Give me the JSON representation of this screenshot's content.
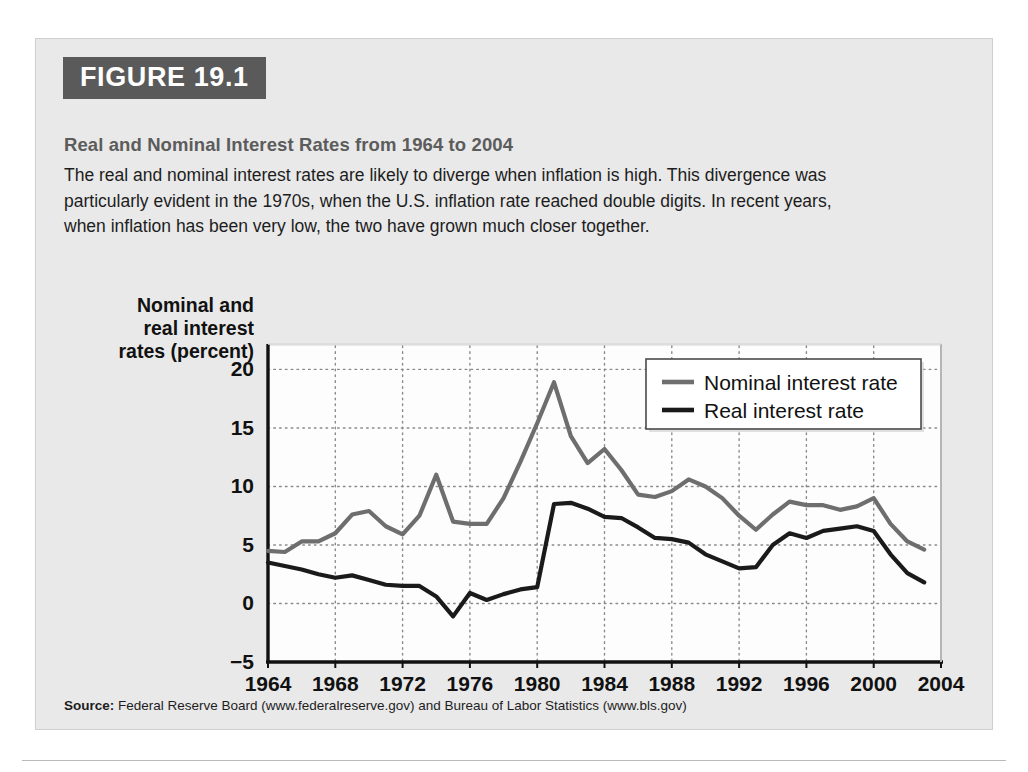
{
  "figure": {
    "tag": "FIGURE 19.1",
    "title": "Real and Nominal Interest Rates from 1964 to 2004",
    "caption": "The real and nominal interest rates are likely to diverge when inflation is high. This divergence was particularly evident in the 1970s, when the U.S. inflation rate reached double digits. In recent years, when inflation has been very low, the two have grown much closer together.",
    "source_label": "Source:",
    "source_text": "Federal Reserve Board (www.federalreserve.gov) and Bureau of Labor Statistics (www.bls.gov)"
  },
  "colors": {
    "panel_bg": "#e9e9e9",
    "tag_bg": "#5a5a5a",
    "title_text": "#5c5c5c",
    "nominal_line": "#6e6e6e",
    "real_line": "#1a1a1a",
    "grid": "#8a8a8a",
    "plot_bg": "#fdfdfd"
  },
  "chart_data": {
    "type": "line",
    "title": "Real and Nominal Interest Rates from 1964 to 2004",
    "xlabel": "Year",
    "ylabel": "Nominal and real interest rates (percent)",
    "ylabel_lines": [
      "Nominal and",
      "real interest",
      "rates (percent)"
    ],
    "xlim": [
      1964,
      2004
    ],
    "ylim": [
      -5,
      22
    ],
    "yticks": [
      20,
      15,
      10,
      5,
      0,
      -5
    ],
    "ytick_labels": [
      "20",
      "15",
      "10",
      "5",
      "0",
      "−5"
    ],
    "xticks": [
      1964,
      1968,
      1972,
      1976,
      1980,
      1984,
      1988,
      1992,
      1996,
      2000,
      2004
    ],
    "xtick_labels": [
      "1964",
      "1968",
      "1972",
      "1976",
      "1980",
      "1984",
      "1988",
      "1992",
      "1996",
      "2000",
      "2004"
    ],
    "grid": true,
    "grid_style": "dotted",
    "legend_position": "top-right",
    "x": [
      1964,
      1965,
      1966,
      1967,
      1968,
      1969,
      1970,
      1971,
      1972,
      1973,
      1974,
      1975,
      1976,
      1977,
      1978,
      1979,
      1980,
      1981,
      1982,
      1983,
      1984,
      1985,
      1986,
      1987,
      1988,
      1989,
      1990,
      1991,
      1992,
      1993,
      1994,
      1995,
      1996,
      1997,
      1998,
      1999,
      2000,
      2001,
      2002,
      2003
    ],
    "series": [
      {
        "name": "Nominal interest rate",
        "color": "#6e6e6e",
        "values": [
          4.5,
          4.4,
          5.3,
          5.3,
          6.0,
          7.6,
          7.9,
          6.6,
          5.9,
          7.5,
          11.0,
          7.0,
          6.8,
          6.8,
          9.0,
          12.1,
          15.4,
          18.9,
          14.3,
          12.0,
          13.2,
          11.4,
          9.3,
          9.1,
          9.6,
          10.6,
          10.0,
          9.0,
          7.5,
          6.3,
          7.6,
          8.7,
          8.4,
          8.4,
          8.0,
          8.3,
          9.0,
          6.8,
          5.3,
          4.6
        ]
      },
      {
        "name": "Real interest rate",
        "color": "#1a1a1a",
        "values": [
          3.5,
          3.2,
          2.9,
          2.5,
          2.2,
          2.4,
          2.0,
          1.6,
          1.5,
          1.5,
          0.6,
          -1.1,
          0.9,
          0.3,
          0.8,
          1.2,
          1.4,
          8.5,
          8.6,
          8.1,
          7.4,
          7.3,
          6.5,
          5.6,
          5.5,
          5.2,
          4.2,
          3.6,
          3.0,
          3.1,
          5.0,
          6.0,
          5.6,
          6.2,
          6.4,
          6.6,
          6.2,
          4.2,
          2.6,
          1.8
        ]
      }
    ]
  },
  "legend": {
    "items": [
      {
        "label": "Nominal interest rate",
        "color": "#6e6e6e"
      },
      {
        "label": "Real interest rate",
        "color": "#1a1a1a"
      }
    ]
  }
}
